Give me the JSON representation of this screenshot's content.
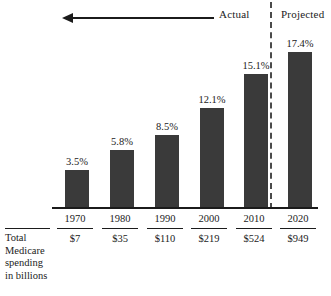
{
  "chart_data": {
    "type": "bar",
    "title": "",
    "subtitle": "",
    "xlabel": "",
    "ylabel": "",
    "ylim": [
      0,
      19
    ],
    "grid": false,
    "legend": "none",
    "categories": [
      "1970",
      "1980",
      "1990",
      "2000",
      "2010",
      "2020"
    ],
    "values": [
      3.5,
      5.8,
      8.5,
      12.1,
      15.1,
      17.4
    ],
    "value_labels": [
      "3.5%",
      "5.8%",
      "8.5%",
      "12.1%",
      "15.1%",
      "17.4%"
    ],
    "series": [
      {
        "name": "Medicare spending as share",
        "values": [
          3.5,
          5.8,
          8.5,
          12.1,
          15.1,
          17.4
        ]
      }
    ],
    "secondary_row": {
      "label_lines": [
        "Total",
        "Medicare",
        "spending",
        "in billions"
      ],
      "values": [
        "$7",
        "$35",
        "$110",
        "$219",
        "$524",
        "$949"
      ]
    },
    "annotations": {
      "actual_label": "Actual",
      "projected_label": "Projected",
      "arrow_direction": "left",
      "divider_between": [
        "2010",
        "2020"
      ]
    },
    "colors": {
      "bar": "#3a3a3a",
      "axis": "#1b1b1b",
      "divider": "#4a4a4a",
      "background": "#ffffff",
      "text": "#1b1b1b"
    }
  },
  "bars": [
    {
      "year": "1970",
      "value_label": "3.5%",
      "amount": "$7",
      "left": 65,
      "top": 170,
      "height": 38,
      "label_left": 57,
      "label_top": 156
    },
    {
      "year": "1980",
      "value_label": "5.8%",
      "amount": "$35",
      "left": 110,
      "top": 150,
      "height": 58,
      "label_left": 102,
      "label_top": 136
    },
    {
      "year": "1990",
      "value_label": "8.5%",
      "amount": "$110",
      "left": 155,
      "top": 135,
      "height": 73,
      "label_left": 147,
      "label_top": 121
    },
    {
      "year": "2000",
      "value_label": "12.1%",
      "amount": "$219",
      "left": 200,
      "top": 108,
      "height": 100,
      "label_left": 192,
      "label_top": 94
    },
    {
      "year": "2010",
      "value_label": "15.1%",
      "amount": "$524",
      "left": 244,
      "top": 74,
      "height": 134,
      "label_left": 236,
      "label_top": 60
    },
    {
      "year": "2020",
      "value_label": "17.4%",
      "amount": "$949",
      "left": 288,
      "top": 52,
      "height": 156,
      "label_left": 280,
      "label_top": 38
    }
  ],
  "columns": [
    {
      "left": 53,
      "rule_left": 57
    },
    {
      "left": 98,
      "rule_left": 102
    },
    {
      "left": 143,
      "rule_left": 147
    },
    {
      "left": 187,
      "rule_left": 191
    },
    {
      "left": 232,
      "rule_left": 236
    },
    {
      "left": 276,
      "rule_left": 280
    }
  ],
  "annotations": {
    "actual": "Actual",
    "projected": "Projected"
  },
  "row_label": {
    "line1": "Total",
    "line2": "Medicare",
    "line3": "spending",
    "line4": "in billions"
  }
}
